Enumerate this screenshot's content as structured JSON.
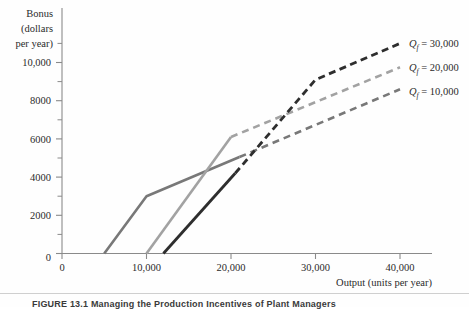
{
  "figure": {
    "caption": "FIGURE 13.1  Managing the Production Incentives of Plant Managers"
  },
  "chart_data": {
    "type": "line",
    "title": "",
    "xlabel": "Output (units per year)",
    "ylabel": "Bonus (dollars per year)",
    "ylabel_lines": [
      "Bonus",
      "(dollars",
      "per year)"
    ],
    "xlim": [
      0,
      43000
    ],
    "ylim": [
      0,
      11600
    ],
    "xticks": [
      0,
      10000,
      20000,
      30000,
      40000
    ],
    "xticklabels": [
      "0",
      "10,000",
      "20,000",
      "30,000",
      "40,000"
    ],
    "yticks": [
      0,
      2000,
      4000,
      6000,
      8000,
      10000
    ],
    "yticklabels": [
      "0",
      "2000",
      "4000",
      "6000",
      "8000",
      "10,000"
    ],
    "yminorticks": [
      1000,
      3000,
      5000,
      7000,
      9000,
      11000
    ],
    "grid": false,
    "legend_position": "right-inside",
    "series": [
      {
        "name": "Qf = 30,000",
        "label_q": "Q",
        "label_sub": "f",
        "label_value": "= 30,000",
        "color": "#2e2e2e",
        "solid_points": [
          [
            12000,
            0
          ],
          [
            20500,
            4200
          ]
        ],
        "dashed_points": [
          [
            20500,
            4200
          ],
          [
            30000,
            9100
          ],
          [
            40000,
            11000
          ]
        ]
      },
      {
        "name": "Qf = 20,000",
        "label_q": "Q",
        "label_sub": "f",
        "label_value": "= 20,000",
        "color": "#a2a2a2",
        "solid_points": [
          [
            10000,
            0
          ],
          [
            20000,
            6100
          ]
        ],
        "dashed_points": [
          [
            20000,
            6100
          ],
          [
            40000,
            9750
          ]
        ]
      },
      {
        "name": "Qf = 10,000",
        "label_q": "Q",
        "label_sub": "f",
        "label_value": "= 10,000",
        "color": "#787878",
        "solid_points": [
          [
            5000,
            0
          ],
          [
            10000,
            3000
          ],
          [
            21000,
            5050
          ]
        ],
        "dashed_points": [
          [
            21000,
            5050
          ],
          [
            40000,
            8600
          ]
        ]
      }
    ]
  }
}
